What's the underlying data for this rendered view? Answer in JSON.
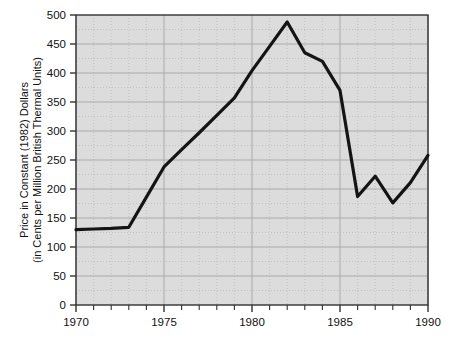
{
  "chart_data": {
    "type": "line",
    "title": "",
    "subtitle": "",
    "xlabel": "",
    "ylabel_line1": "Price in Constant (1982) Dollars",
    "ylabel_line2": "(in Cents per Million British Thermal Units)",
    "x": [
      1970,
      1971,
      1972,
      1973,
      1974,
      1975,
      1976,
      1977,
      1978,
      1979,
      1980,
      1981,
      1982,
      1983,
      1984,
      1985,
      1986,
      1987,
      1988,
      1989,
      1990
    ],
    "values": [
      130,
      131,
      132,
      134,
      186,
      238,
      268,
      297,
      327,
      357,
      404,
      446,
      488,
      435,
      420,
      370,
      187,
      222,
      176,
      211,
      258
    ],
    "series": [
      {
        "name": "Price in Constant (1982) Dollars",
        "values": [
          130,
          131,
          132,
          134,
          186,
          238,
          268,
          297,
          327,
          357,
          404,
          446,
          488,
          435,
          420,
          370,
          187,
          222,
          176,
          211,
          258
        ]
      }
    ],
    "xlim": [
      1970,
      1990
    ],
    "ylim": [
      0,
      500
    ],
    "x_major_ticks": [
      1970,
      1975,
      1980,
      1985,
      1990
    ],
    "x_major_tick_labels": [
      "1970",
      "1975",
      "1980",
      "1985",
      "1990"
    ],
    "x_minor_ticks": [
      1971,
      1972,
      1973,
      1974,
      1976,
      1977,
      1978,
      1979,
      1981,
      1982,
      1983,
      1984,
      1986,
      1987,
      1988,
      1989
    ],
    "y_major_ticks": [
      0,
      50,
      100,
      150,
      200,
      250,
      300,
      350,
      400,
      450,
      500
    ],
    "y_major_tick_labels": [
      "0",
      "50",
      "100",
      "150",
      "200",
      "250",
      "300",
      "350",
      "400",
      "450",
      "500"
    ],
    "grid": "major-solid-minor-dotted",
    "legend": "none",
    "legend_position": "none",
    "annotations": [],
    "colors": {
      "line": "#141414",
      "plot_background": "#dcdcdc",
      "frame": "#333333",
      "major_gridline": "#aaaaaa",
      "minor_gridline": "#bbbbbb",
      "page_background": "#ffffff",
      "text": "#111111"
    }
  }
}
